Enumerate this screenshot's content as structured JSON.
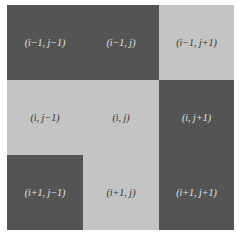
{
  "colors": {
    "dark": "#545454",
    "light": "#c4c4c4"
  },
  "cells": [
    {
      "row": 0,
      "col": 0,
      "label": "(i−1, j−1)",
      "shade": "dark"
    },
    {
      "row": 0,
      "col": 1,
      "label": "(i−1, j)",
      "shade": "dark"
    },
    {
      "row": 0,
      "col": 2,
      "label": "(i−1, j+1)",
      "shade": "light"
    },
    {
      "row": 1,
      "col": 0,
      "label": "(i, j−1)",
      "shade": "light"
    },
    {
      "row": 1,
      "col": 1,
      "label": "(i, j)",
      "shade": "light"
    },
    {
      "row": 1,
      "col": 2,
      "label": "(i, j+1)",
      "shade": "dark"
    },
    {
      "row": 2,
      "col": 0,
      "label": "(i+1, j−1)",
      "shade": "dark"
    },
    {
      "row": 2,
      "col": 1,
      "label": "(i+1, j)",
      "shade": "light"
    },
    {
      "row": 2,
      "col": 2,
      "label": "(i+1, j+1)",
      "shade": "dark"
    }
  ]
}
